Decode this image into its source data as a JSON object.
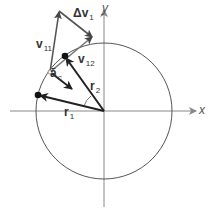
{
  "diagram": {
    "type": "physics-vector-diagram",
    "axes": {
      "x_label": "x",
      "y_label": "y"
    },
    "colors": {
      "axis": "#888888",
      "circle": "#555555",
      "vector": "#444444",
      "dark_vector": "#222222",
      "dot": "#111111"
    },
    "labels": {
      "delta_v": {
        "symbol": "Δv",
        "sub": "1"
      },
      "v11": {
        "symbol": "v",
        "sub": "11"
      },
      "v12": {
        "symbol": "v",
        "sub": "12"
      },
      "ac": {
        "symbol": "ā",
        "sub": "c"
      },
      "r1": {
        "symbol": "r",
        "sub": "1"
      },
      "r2": {
        "symbol": "r",
        "sub": "2"
      }
    },
    "points": {
      "origin": [
        104,
        111
      ],
      "r1_tip": [
        38,
        95
      ],
      "r2_tip": [
        65,
        56
      ],
      "midpoint": [
        50,
        72
      ],
      "v11_tip": [
        59,
        11
      ],
      "dv_tip": [
        92,
        37
      ]
    },
    "circle_radius": 68
  }
}
